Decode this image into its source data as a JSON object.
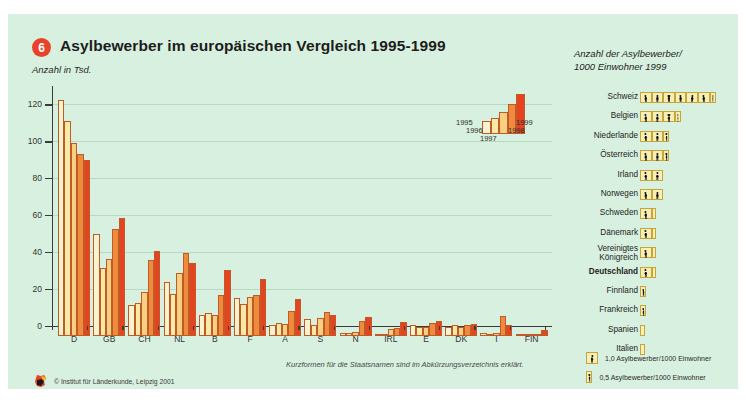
{
  "header": {
    "badge": "6",
    "title": "Asylbewerber im europäischen Vergleich 1995-1999",
    "subtitle": "Anzahl in Tsd."
  },
  "footnote": "Kurzformen für die Staatsnamen sind im Abkürzungsverzeichnis erklärt.",
  "source": {
    "text": "© Institut für Länderkunde, Leipzig 2001",
    "logo_icon": "germany-map-icon"
  },
  "year_key": {
    "years": [
      "1995",
      "1996",
      "1997",
      "1998",
      "1999"
    ],
    "values": [
      10,
      12,
      16,
      22,
      30
    ]
  },
  "colors": {
    "year_1995": "#fbf3cf",
    "year_1996": "#fbe9a8",
    "year_1997": "#f9cf82",
    "year_1998": "#ef8b3c",
    "year_1999": "#e4441f",
    "accent": "#e8432a",
    "background": "#d8f0df",
    "grid": "#b6d9c0",
    "picto_fill": "#f7efb4",
    "picto_border": "#c8a53a"
  },
  "chart_data": {
    "type": "bar",
    "title": "Asylbewerber im europäischen Vergleich 1995-1999",
    "xlabel": "",
    "ylabel": "Anzahl in Tsd.",
    "ylim": [
      0,
      130
    ],
    "yticks": [
      0,
      20,
      40,
      60,
      80,
      100,
      120
    ],
    "grid": true,
    "legend_position": "inside-right",
    "categories": [
      "D",
      "GB",
      "CH",
      "NL",
      "B",
      "F",
      "A",
      "S",
      "N",
      "IRL",
      "E",
      "DK",
      "I",
      "FIN"
    ],
    "series": [
      {
        "name": "1995",
        "values": [
          127.9,
          55.0,
          17.0,
          29.3,
          11.4,
          20.4,
          5.9,
          9.0,
          1.5,
          0.4,
          5.7,
          5.1,
          1.7,
          0.9
        ]
      },
      {
        "name": "1996",
        "values": [
          116.4,
          37.0,
          18.0,
          22.9,
          12.4,
          17.4,
          7.0,
          5.8,
          1.8,
          1.2,
          4.7,
          5.9,
          0.7,
          0.7
        ]
      },
      {
        "name": "1997",
        "values": [
          104.4,
          41.5,
          24.0,
          34.4,
          11.6,
          21.4,
          6.7,
          9.6,
          2.3,
          3.9,
          5.0,
          5.1,
          1.9,
          1.0
        ]
      },
      {
        "name": "1998",
        "values": [
          98.6,
          58.0,
          41.3,
          45.2,
          22.0,
          22.4,
          13.8,
          13.0,
          8.4,
          4.6,
          6.8,
          5.7,
          11.1,
          1.3
        ]
      },
      {
        "name": "1999",
        "values": [
          95.1,
          64.0,
          46.0,
          39.3,
          35.8,
          30.9,
          20.1,
          11.2,
          10.2,
          7.7,
          8.4,
          6.5,
          6.2,
          3.1
        ]
      }
    ]
  },
  "panel": {
    "title_line1": "Anzahl der Asylbewerber/",
    "title_line2": "1000 Einwohner 1999",
    "rows": [
      {
        "label": "Schweiz",
        "value": 6.5
      },
      {
        "label": "Belgien",
        "value": 3.5
      },
      {
        "label": "Niederlande",
        "value": 2.5
      },
      {
        "label": "Österreich",
        "value": 2.5
      },
      {
        "label": "Irland",
        "value": 2.0
      },
      {
        "label": "Norwegen",
        "value": 2.0
      },
      {
        "label": "Schweden",
        "value": 1.3
      },
      {
        "label": "Dänemark",
        "value": 1.2
      },
      {
        "label": "Vereinigtes Königreich",
        "value": 1.2,
        "two_line": true
      },
      {
        "label": "Deutschland",
        "value": 1.2,
        "bold": true
      },
      {
        "label": "Finnland",
        "value": 0.5
      },
      {
        "label": "Frankreich",
        "value": 0.5
      },
      {
        "label": "Spanien",
        "value": 0.2
      },
      {
        "label": "Italien",
        "value": 0.2
      }
    ]
  },
  "keys": [
    {
      "text": "1,0 Asylbewerber/1000 Einwohner",
      "size": "full"
    },
    {
      "text": "0,5 Asylbewerber/1000 Einwohner",
      "size": "half"
    }
  ]
}
